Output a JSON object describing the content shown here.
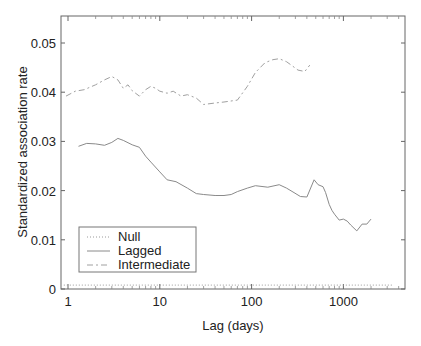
{
  "chart_data": {
    "type": "line",
    "title": "",
    "xlabel": "Lag (days)",
    "ylabel": "Standardized association rate",
    "xscale": "log",
    "xlim": [
      0.85,
      3800
    ],
    "ylim": [
      0,
      0.055
    ],
    "x_ticks": [
      1,
      10,
      100,
      1000
    ],
    "x_tick_labels": [
      "1",
      "10",
      "100",
      "1000"
    ],
    "y_ticks": [
      0,
      0.01,
      0.02,
      0.03,
      0.04,
      0.05
    ],
    "y_tick_labels": [
      "0",
      "0.01",
      "0.02",
      "0.03",
      "0.04",
      "0.05"
    ],
    "grid": false,
    "legend_position": "lower left",
    "series": [
      {
        "name": "Null",
        "style": "dotted",
        "color": "#9a9a9a",
        "x": [
          0.9,
          3500
        ],
        "y": [
          0.0008,
          0.0008
        ]
      },
      {
        "name": "Lagged",
        "style": "solid",
        "color": "#8a8a8a",
        "x": [
          1.3,
          1.6,
          2.0,
          2.5,
          3.0,
          3.5,
          4.0,
          5.0,
          6.0,
          7.0,
          8.0,
          10,
          12,
          15,
          20,
          25,
          30,
          40,
          50,
          60,
          70,
          90,
          110,
          150,
          200,
          240,
          290,
          340,
          400,
          480,
          530,
          600,
          640,
          700,
          750,
          800,
          900,
          1000,
          1100,
          1200,
          1400,
          1600,
          1800,
          2000
        ],
        "y": [
          0.029,
          0.0296,
          0.0295,
          0.0292,
          0.0298,
          0.0306,
          0.0302,
          0.0293,
          0.0288,
          0.027,
          0.0258,
          0.0238,
          0.0222,
          0.0218,
          0.0205,
          0.0194,
          0.0192,
          0.019,
          0.019,
          0.0192,
          0.0198,
          0.0205,
          0.021,
          0.0207,
          0.0212,
          0.0205,
          0.0196,
          0.0188,
          0.0187,
          0.0222,
          0.0212,
          0.0208,
          0.0196,
          0.0172,
          0.016,
          0.0152,
          0.014,
          0.0142,
          0.0138,
          0.013,
          0.0118,
          0.0132,
          0.0132,
          0.0142
        ]
      },
      {
        "name": "Intermediate",
        "style": "dashdot",
        "color": "#a0a0a0",
        "x": [
          0.95,
          1.2,
          1.5,
          2.0,
          2.5,
          3.0,
          3.5,
          4.0,
          4.5,
          5.0,
          6.0,
          7.0,
          8.0,
          9.0,
          10,
          12,
          14,
          17,
          20,
          25,
          30,
          40,
          50,
          70,
          90,
          110,
          140,
          170,
          200,
          240,
          280,
          320,
          380,
          430
        ],
        "y": [
          0.0392,
          0.0402,
          0.0405,
          0.0415,
          0.0425,
          0.0432,
          0.0425,
          0.0408,
          0.0415,
          0.0403,
          0.0392,
          0.0405,
          0.0412,
          0.0408,
          0.0402,
          0.0398,
          0.0402,
          0.0392,
          0.0395,
          0.0388,
          0.0375,
          0.0378,
          0.038,
          0.0384,
          0.0412,
          0.044,
          0.046,
          0.0466,
          0.0468,
          0.0462,
          0.0453,
          0.0445,
          0.0442,
          0.0455
        ]
      }
    ]
  },
  "legend": {
    "items": [
      {
        "label": "Null"
      },
      {
        "label": "Lagged"
      },
      {
        "label": "Intermediate"
      }
    ]
  },
  "axes": {
    "xlabel": "Lag (days)",
    "ylabel": "Standardized association rate"
  }
}
